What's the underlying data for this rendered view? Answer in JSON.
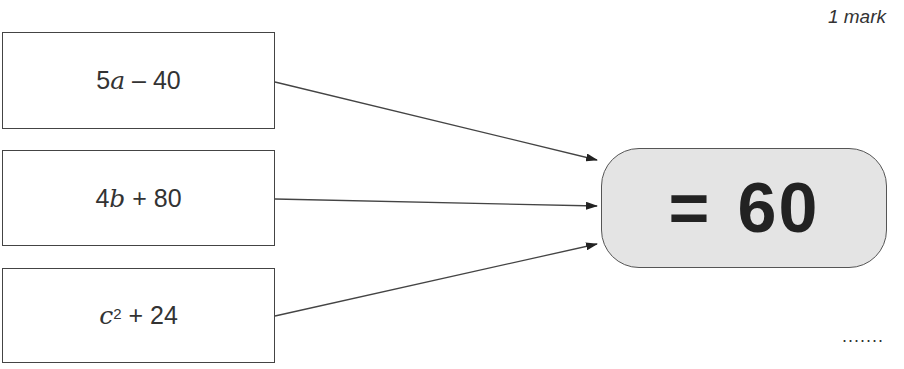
{
  "header": {
    "marks": "1 mark"
  },
  "expressions": [
    {
      "coef": "5",
      "var": "a",
      "exp": "",
      "op": " – ",
      "const": "40"
    },
    {
      "coef": "4",
      "var": "b",
      "exp": "",
      "op": " + ",
      "const": "80"
    },
    {
      "coef": "",
      "var": "c",
      "exp": "2",
      "op": " + ",
      "const": "24"
    }
  ],
  "target": {
    "symbol": "=",
    "value": "60",
    "fill_color": "#e4e4e4"
  },
  "answer": {
    "placeholder": "......."
  }
}
